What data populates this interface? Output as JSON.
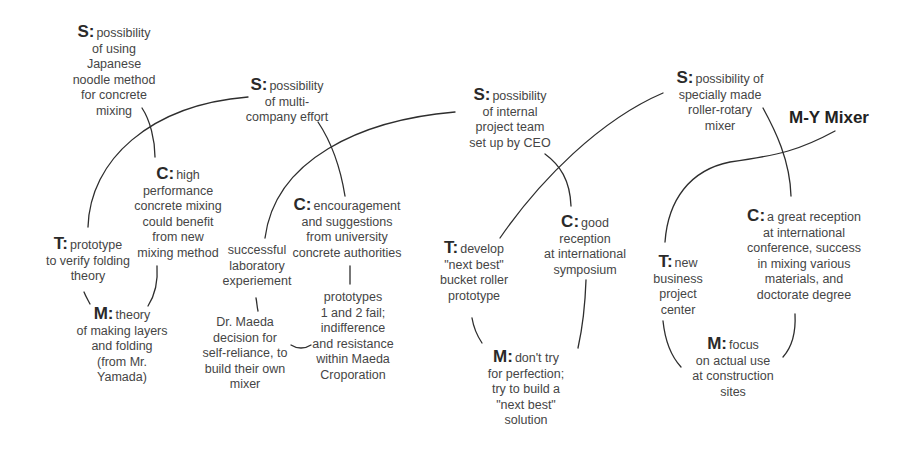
{
  "diagram": {
    "title": "M-Y Mixer",
    "legend_note": "S = situation, C = context, T = trial, M = method",
    "nodes": {
      "s1": {
        "tag": "S:",
        "lines": [
          "possibility",
          "of using",
          "Japanese",
          "noodle method",
          "for concrete",
          "mixing"
        ]
      },
      "c1": {
        "tag": "C:",
        "lines": [
          "high",
          "performance",
          "concrete mixing",
          "could benefit",
          "from new",
          "mixing method"
        ]
      },
      "t1": {
        "tag": "T:",
        "lines": [
          "prototype",
          "to verify folding",
          "theory"
        ]
      },
      "m1": {
        "tag": "M:",
        "lines": [
          "theory",
          "of making layers",
          "and folding",
          "(from Mr.",
          "Yamada)"
        ]
      },
      "s2": {
        "tag": "S:",
        "lines": [
          "possibility",
          "of multi-",
          "company effort"
        ]
      },
      "c2": {
        "tag": "C:",
        "lines": [
          "encouragement",
          "and suggestions",
          "from university",
          "concrete authorities"
        ]
      },
      "t2": {
        "tag": "",
        "lines": [
          "successful",
          "laboratory",
          "experiement"
        ]
      },
      "m2": {
        "tag": "",
        "lines": [
          "Dr. Maeda",
          "decision for",
          "self-reliance, to",
          "build their own",
          "mixer"
        ]
      },
      "p2": {
        "tag": "",
        "lines": [
          "prototypes",
          "1 and 2 fail;",
          "indifference",
          "and resistance",
          "within Maeda",
          "Croporation"
        ]
      },
      "s3": {
        "tag": "S:",
        "lines": [
          "possibility",
          "of internal",
          "project team",
          "set up by CEO"
        ]
      },
      "c3": {
        "tag": "C:",
        "lines": [
          "good",
          "reception",
          "at international",
          "symposium"
        ]
      },
      "t3": {
        "tag": "T:",
        "lines": [
          "develop",
          "\"next best\"",
          "bucket roller",
          "prototype"
        ]
      },
      "m3": {
        "tag": "M:",
        "lines": [
          "don't try",
          "for perfection;",
          "try to build a",
          "\"next best\"",
          "solution"
        ]
      },
      "s4": {
        "tag": "S:",
        "lines": [
          "possibility of",
          "specially made",
          "roller-rotary",
          "mixer"
        ]
      },
      "c4": {
        "tag": "C:",
        "lines": [
          "a great reception",
          "at international",
          "conference, success",
          "in mixing various",
          "materials, and",
          "doctorate degree"
        ]
      },
      "t4": {
        "tag": "T:",
        "lines": [
          "new",
          "business",
          "project",
          "center"
        ]
      },
      "m4": {
        "tag": "M:",
        "lines": [
          "focus",
          "on actual use",
          "at construction",
          "sites"
        ]
      }
    }
  }
}
